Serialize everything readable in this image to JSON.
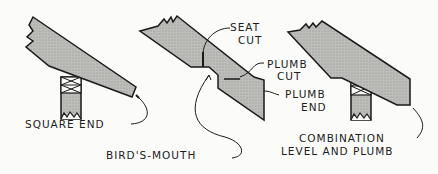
{
  "diagram": {
    "figures": [
      {
        "id": "square-end",
        "labels": [
          "SQUARE END"
        ]
      },
      {
        "id": "birds-mouth",
        "labels": [
          "SEAT CUT",
          "PLUMB CUT",
          "PLUMB END",
          "BIRD'S-MOUTH"
        ]
      },
      {
        "id": "combination",
        "labels": [
          "COMBINATION LEVEL AND PLUMB"
        ]
      }
    ]
  },
  "labels": {
    "square_end": "SQUARE END",
    "seat_cut_1": "SEAT",
    "seat_cut_2": "CUT",
    "plumb_cut_1": "PLUMB",
    "plumb_cut_2": "CUT",
    "plumb_end_1": "PLUMB",
    "plumb_end_2": "END",
    "birds_mouth": "BIRD'S-MOUTH",
    "combination_1": "COMBINATION",
    "combination_2": "LEVEL AND PLUMB"
  },
  "colors": {
    "fill": "#b9b9b6",
    "stroke": "#1a1a1a",
    "background": "#fbfbfa"
  }
}
